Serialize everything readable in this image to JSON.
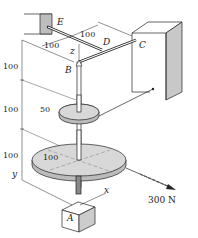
{
  "diagram": {
    "type": "engineering-mechanics-3d-shaft",
    "points": {
      "A": "A",
      "B": "B",
      "C": "C",
      "D": "D",
      "E": "E"
    },
    "axes": {
      "x": "x",
      "y": "y",
      "z": "z"
    },
    "dimensions": {
      "ED": "100",
      "DC": "100",
      "vertical_top": "100",
      "vertical_mid": "100",
      "vertical_bottom": "100",
      "small_pulley_radius": "50",
      "large_pulley_radius": "100"
    },
    "load": {
      "label": "300 N"
    },
    "colors": {
      "line": "#222222",
      "pulley_fill": "#d8d8d8",
      "wall_shade": "#c8c8c8",
      "bracket_shade": "#bdbdbd"
    }
  }
}
